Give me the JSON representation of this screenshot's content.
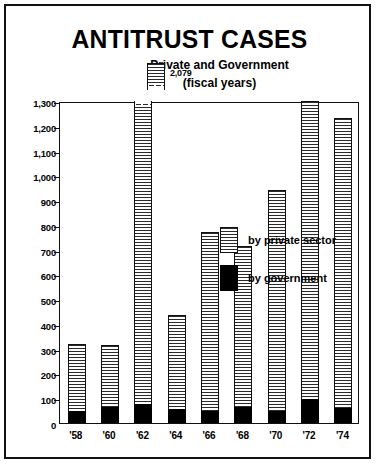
{
  "chart_data": {
    "type": "bar",
    "title": "ANTITRUST CASES",
    "subtitle_line1": "Private and Government",
    "subtitle_line2": "(fiscal years)",
    "xlabel": "",
    "ylabel": "",
    "ylim": [
      0,
      1300
    ],
    "grid": false,
    "stacked": true,
    "legend_position": "inside-upper-left",
    "categories": [
      "'58",
      "'60",
      "'62",
      "'64",
      "'66",
      "'68",
      "'70",
      "'72",
      "'74"
    ],
    "series": [
      {
        "name": "by government",
        "color": "#000000",
        "values": [
          50,
          65,
          75,
          55,
          50,
          65,
          50,
          95,
          60
        ]
      },
      {
        "name": "by private sector",
        "color": "#ffffff",
        "pattern": "horizontal-hatch",
        "values": [
          270,
          250,
          2004,
          380,
          720,
          650,
          890,
          1205,
          1170
        ]
      }
    ],
    "totals": [
      320,
      315,
      2079,
      435,
      770,
      715,
      940,
      1300,
      1230
    ],
    "annotations": [
      {
        "category": "'62",
        "text": "2,079",
        "note": "bar truncated with axis break; actual total exceeds plot ceiling"
      }
    ],
    "y_ticks": [
      "0",
      "100",
      "200",
      "300",
      "400",
      "500",
      "600",
      "700",
      "800",
      "900",
      "1,000",
      "1,100",
      "1,200",
      "1,300"
    ],
    "y_tick_values": [
      0,
      100,
      200,
      300,
      400,
      500,
      600,
      700,
      800,
      900,
      1000,
      1100,
      1200,
      1300
    ],
    "legend_entries": [
      {
        "label": "by private sector",
        "swatch": "private"
      },
      {
        "label": "by government",
        "swatch": "gov"
      }
    ]
  }
}
